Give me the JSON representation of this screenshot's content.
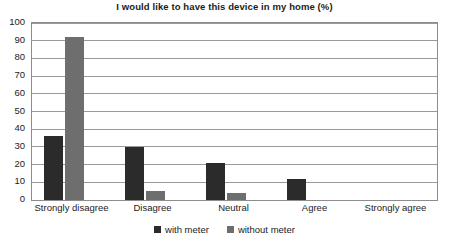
{
  "chart_data": {
    "type": "bar",
    "title": "I would like to have this device in my home (%)",
    "xlabel": "",
    "ylabel": "",
    "ylim": [
      0,
      100
    ],
    "ytick_step": 10,
    "yticks": [
      100,
      90,
      80,
      70,
      60,
      50,
      40,
      30,
      20,
      10,
      0
    ],
    "grid": true,
    "legend_position": "bottom-center",
    "categories": [
      "Strongly disagree",
      "Disagree",
      "Neutral",
      "Agree",
      "Strongly agree"
    ],
    "series": [
      {
        "name": "with meter",
        "color": "#2b2b2b",
        "values": [
          36,
          30,
          21,
          12,
          0
        ]
      },
      {
        "name": "without meter",
        "color": "#6e6e6e",
        "values": [
          92,
          5,
          4,
          0,
          0
        ]
      }
    ]
  },
  "colors": {
    "with_meter": "#2b2b2b",
    "without_meter": "#6e6e6e",
    "gridline": "#9a9a9a",
    "frame": "#8d8d8d",
    "text": "#1c1c1c",
    "background": "#ffffff"
  }
}
